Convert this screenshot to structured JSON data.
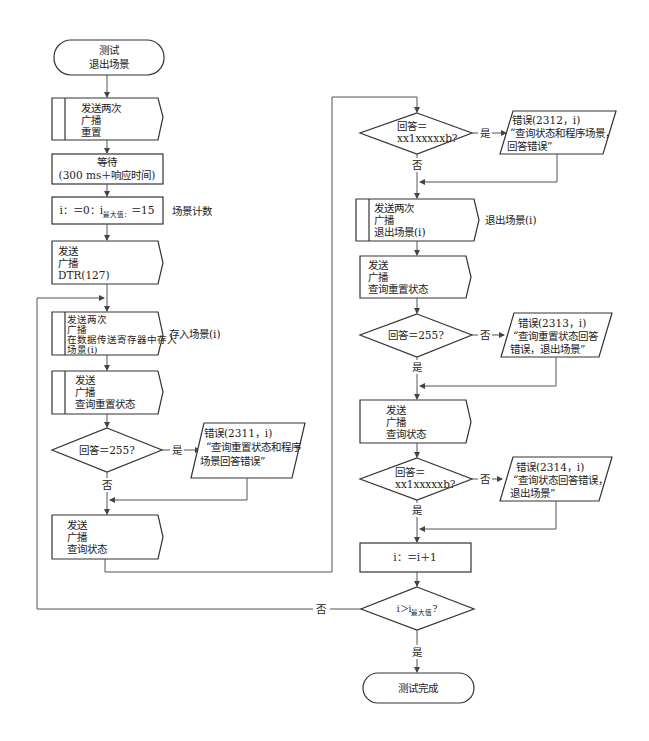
{
  "diagram": {
    "type": "flowchart",
    "left_column": {
      "start": {
        "lines": [
          "测试",
          "退出场景"
        ]
      },
      "send_reset": {
        "lines": [
          "发送两次",
          "广播",
          "重置"
        ]
      },
      "wait": {
        "lines": [
          "等待",
          "(300 ms＋响应时间)"
        ]
      },
      "init": {
        "text_pre": "i：＝0：i",
        "subscript": "最大值：",
        "text_post": "＝15",
        "side_note": "场景计数"
      },
      "send_dtr": {
        "lines": [
          "发送",
          "广播",
          "DTR(127)"
        ]
      },
      "store_scene": {
        "lines": [
          "发送两次",
          "广播",
          "在数据传送寄存器中存入",
          "场景(i)"
        ],
        "side_note": "存入场景(i)"
      },
      "query_reset_1": {
        "lines": [
          "发送",
          "广播",
          "查询重置状态"
        ]
      },
      "decision_1": {
        "text": "回答＝255?",
        "yes_label": "是",
        "no_label": "否"
      },
      "error_2311": {
        "lines": [
          "错误(2311，i)",
          "“查询重置状态和程序",
          "场景回答错误”"
        ]
      },
      "query_status_1": {
        "lines": [
          "发送",
          "广播",
          "查询状态"
        ]
      }
    },
    "right_column": {
      "decision_2": {
        "lines": [
          "回答＝",
          "xx1xxxxxb?"
        ],
        "yes_label": "是",
        "no_label": "否"
      },
      "error_2312": {
        "lines": [
          "错误(2312，i)",
          "“查询状态和程序场景，",
          "回答错误”"
        ]
      },
      "exit_scene": {
        "lines": [
          "发送两次",
          "广播",
          "退出场景(i)"
        ],
        "side_note": "退出场景(i)"
      },
      "query_reset_2": {
        "lines": [
          "发送",
          "广播",
          "查询重置状态"
        ]
      },
      "decision_3": {
        "text": "回答＝255?",
        "yes_label": "是",
        "no_label": "否"
      },
      "error_2313": {
        "lines": [
          "错误(2313，i)",
          "“查询重置状态回答",
          "错误，退出场景”"
        ]
      },
      "query_status_2": {
        "lines": [
          "发送",
          "广播",
          "查询状态"
        ]
      },
      "decision_4": {
        "lines": [
          "回答＝",
          "xx1xxxxxb?"
        ],
        "yes_label": "是",
        "no_label": "否"
      },
      "error_2314": {
        "lines": [
          "错误(2314，i)",
          "“查询状态回答错误，",
          "退出场景”"
        ]
      },
      "increment": {
        "text": "i：＝i＋1"
      },
      "decision_5": {
        "text_pre": "i＞i",
        "subscript": "最大值",
        "text_post": "?",
        "yes_label": "是",
        "no_label": "否"
      },
      "end": {
        "text": "测试完成"
      }
    }
  }
}
